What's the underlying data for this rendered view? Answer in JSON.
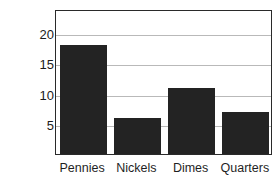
{
  "chart_data": {
    "type": "bar",
    "title": "",
    "xlabel": "",
    "ylabel": "NUMBER OF COINS",
    "categories": [
      "Pennies",
      "Nickels",
      "Dimes",
      "Quarters"
    ],
    "values": [
      18,
      6,
      11,
      7
    ],
    "ylim": [
      0,
      24
    ],
    "yticks": [
      5,
      10,
      15,
      20
    ],
    "ytick_labels": [
      "5",
      "10",
      "15",
      "20"
    ],
    "grid": "horizontal",
    "legend": "none",
    "bar_color": "#232323",
    "gridline_color": "#b9b9b9",
    "frame_color": "#2a2a2a",
    "background_color": "#ffffff"
  }
}
